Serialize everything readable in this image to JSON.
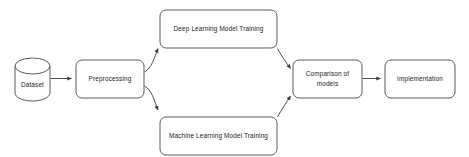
{
  "diagram": {
    "background_color": "#ffffff",
    "node_fill": "#ffffff",
    "node_stroke": "#4a4a4a",
    "edge_color": "#3a3a3a",
    "text_color": "#1a1a1a",
    "nodes": [
      {
        "id": "dataset",
        "label": "Dataset",
        "shape": "cylinder",
        "x": 15,
        "y": 58,
        "w": 35,
        "h": 43
      },
      {
        "id": "preprocessing",
        "label": "Preprocessing",
        "shape": "rounded-rect",
        "x": 76,
        "y": 60,
        "w": 68,
        "h": 38
      },
      {
        "id": "deep-learning-model-training",
        "label": "Deep Learning Model Training",
        "shape": "rounded-rect",
        "x": 160,
        "y": 10,
        "w": 117,
        "h": 38
      },
      {
        "id": "machine-learning-model-training",
        "label": "Machine Learning Model Training",
        "shape": "rounded-rect",
        "x": 160,
        "y": 117,
        "w": 117,
        "h": 38
      },
      {
        "id": "comparison-of-models",
        "label": "Comparison of models",
        "label_line1": "Comparison of",
        "label_line2": "models",
        "shape": "rounded-rect",
        "x": 293,
        "y": 60,
        "w": 69,
        "h": 38
      },
      {
        "id": "implementation",
        "label": "Implementation",
        "shape": "rounded-rect",
        "x": 385,
        "y": 60,
        "w": 70,
        "h": 38
      }
    ],
    "edges": [
      {
        "id": "dataset-to-preprocessing",
        "from": "dataset",
        "to": "preprocessing",
        "style": "straight-horizontal"
      },
      {
        "id": "preprocessing-to-deep-learning",
        "from": "preprocessing",
        "to": "deep-learning-model-training",
        "style": "curved-up"
      },
      {
        "id": "preprocessing-to-machine-learning",
        "from": "preprocessing",
        "to": "machine-learning-model-training",
        "style": "curved-down"
      },
      {
        "id": "deep-learning-to-comparison",
        "from": "deep-learning-model-training",
        "to": "comparison-of-models",
        "style": "curved-down"
      },
      {
        "id": "machine-learning-to-comparison",
        "from": "machine-learning-model-training",
        "to": "comparison-of-models",
        "style": "curved-up"
      },
      {
        "id": "comparison-to-implementation",
        "from": "comparison-of-models",
        "to": "implementation",
        "style": "straight-horizontal"
      }
    ]
  }
}
